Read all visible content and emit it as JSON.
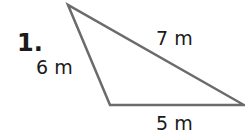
{
  "problem": {
    "number": "1.",
    "side_left": "6 m",
    "side_top": "7 m",
    "side_bottom": "5 m"
  },
  "colors": {
    "stroke": "#6b6b6b",
    "text": "#1a1a1a"
  }
}
